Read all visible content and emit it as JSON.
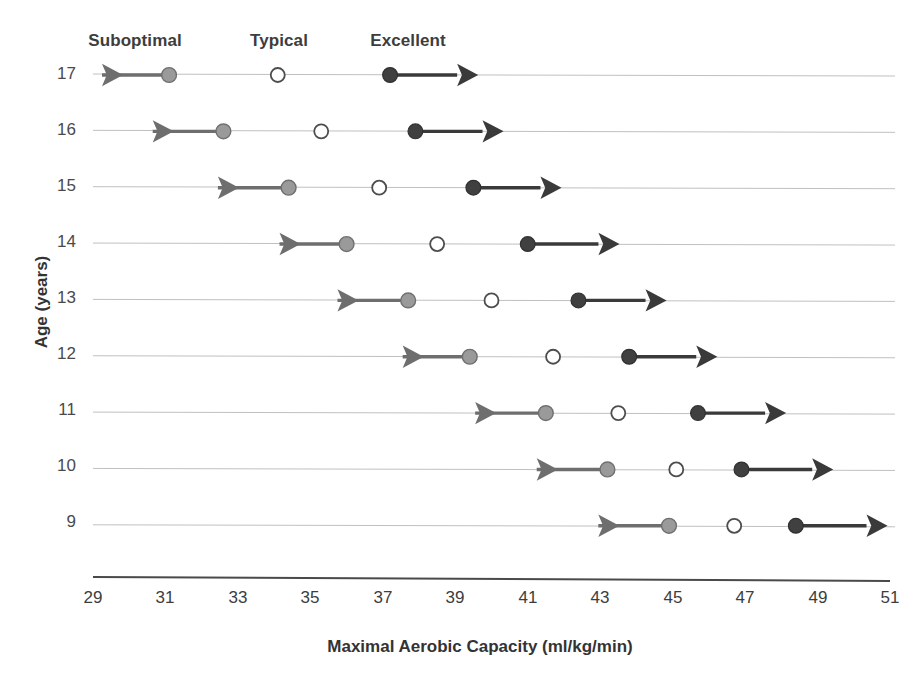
{
  "chart_data": {
    "type": "scatter",
    "title": "",
    "xlabel": "Maximal Aerobic Capacity (ml/kg/min)",
    "ylabel": "Age (years)",
    "xlim": [
      29,
      51
    ],
    "ylim": [
      8.5,
      17.5
    ],
    "xticks": [
      29,
      31,
      33,
      35,
      37,
      39,
      41,
      43,
      45,
      47,
      49,
      51
    ],
    "xtick_labels": [
      "29",
      "31",
      "33",
      "35",
      "37",
      "39",
      "41",
      "43",
      "45",
      "47",
      "49",
      "51"
    ],
    "yticks": [
      17,
      16,
      15,
      14,
      13,
      12,
      11,
      10,
      9
    ],
    "ytick_labels": [
      "17",
      "16",
      "15",
      "14",
      "13",
      "12",
      "11",
      "10",
      "9"
    ],
    "grid": false,
    "legend_position": "top",
    "legend": [
      {
        "label": "Suboptimal",
        "marker": "filled-gray-circle",
        "color": "#9a9a9a",
        "x_center": 31.1
      },
      {
        "label": "Typical",
        "marker": "open-circle",
        "color": "#ffffff",
        "x_center": 34.1
      },
      {
        "label": "Excellent",
        "marker": "filled-dark-circle",
        "color": "#404040",
        "x_center": 37.2
      }
    ],
    "series": [
      {
        "name": "Suboptimal",
        "marker": "filled-gray-circle",
        "color": "#9a9a9a",
        "arrow": "left",
        "values": [
          31.1,
          32.6,
          34.4,
          36.0,
          37.7,
          39.4,
          41.5,
          43.2,
          44.9
        ],
        "arrow_tip": [
          29.0,
          30.4,
          32.2,
          33.9,
          35.5,
          37.3,
          39.3,
          41.0,
          42.7
        ]
      },
      {
        "name": "Typical",
        "marker": "open-circle",
        "color": "#ffffff",
        "arrow": "none",
        "values": [
          34.1,
          35.3,
          36.9,
          38.5,
          40.0,
          41.7,
          43.5,
          45.1,
          46.7
        ]
      },
      {
        "name": "Excellent",
        "marker": "filled-dark-circle",
        "color": "#404040",
        "arrow": "right",
        "values": [
          37.2,
          37.9,
          39.5,
          41.0,
          42.4,
          43.8,
          45.7,
          46.9,
          48.4
        ],
        "arrow_tip": [
          39.3,
          40.0,
          41.6,
          43.2,
          44.5,
          45.9,
          47.8,
          49.1,
          50.6
        ]
      }
    ],
    "categories": [
      17,
      16,
      15,
      14,
      13,
      12,
      11,
      10,
      9
    ],
    "row_line_color": "#b9b9b9",
    "axis_color": "#4a4a4a",
    "background": "#ffffff"
  }
}
